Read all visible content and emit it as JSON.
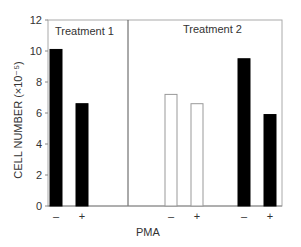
{
  "chart_data": {
    "type": "bar",
    "title": "",
    "xlabel": "PMA",
    "ylabel": "CELL NUMBER (×10⁻⁵)",
    "ylim": [
      0,
      12
    ],
    "yticks": [
      0,
      2,
      4,
      6,
      8,
      10,
      12
    ],
    "grid": false,
    "legend": "none",
    "panels": [
      {
        "label": "Treatment 1",
        "bars": [
          {
            "category": "–",
            "value": 10.1,
            "fill": "solid"
          },
          {
            "category": "+",
            "value": 6.6,
            "fill": "solid"
          }
        ]
      },
      {
        "label": "Treatment 2",
        "bars": [
          {
            "category": "–",
            "value": 7.2,
            "fill": "open"
          },
          {
            "category": "+",
            "value": 6.6,
            "fill": "open"
          },
          {
            "category": "–",
            "value": 9.5,
            "fill": "solid"
          },
          {
            "category": "+",
            "value": 5.9,
            "fill": "solid"
          }
        ]
      }
    ],
    "colors": {
      "solid": "#000000",
      "open": "#ffffff",
      "axis": "#888888"
    }
  }
}
